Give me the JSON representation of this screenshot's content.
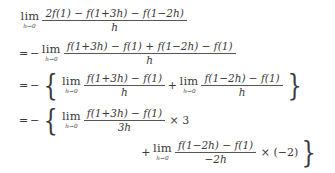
{
  "document": {
    "type": "math-derivation",
    "subject": "limit-of-difference-quotient",
    "background_color": "#ffffff",
    "text_color": "#3a3a3a"
  },
  "symbols": {
    "lim": "lim",
    "lim_subscript": "h→0",
    "equals": "=",
    "minus": "−",
    "plus": "+",
    "times": "×",
    "open_brace": "{",
    "close_brace": "}",
    "f": "f",
    "h": "h",
    "one": "1",
    "two": "2",
    "three": "3",
    "paren_open": "(",
    "paren_close": ")"
  },
  "lines": [
    {
      "id": "line1",
      "label": "original-limit",
      "prefix": "",
      "lim_sub": "h→0",
      "numerator": "2f(1) − f(1+3h) − f(1−2h)",
      "denominator": "h"
    },
    {
      "id": "line2",
      "label": "factored-negative",
      "prefix": "= −",
      "lim_sub": "h→0",
      "numerator": "f(1+3h) − f(1) + f(1−2h) − f(1)",
      "denominator": "h"
    },
    {
      "id": "line3",
      "label": "split-into-two-limits",
      "prefix": "= −",
      "open_delim": "{",
      "close_delim": "}",
      "term_a": {
        "lim_sub": "h→0",
        "numerator": "f(1+3h) − f(1)",
        "denominator": "h"
      },
      "joiner": "+",
      "term_b": {
        "lim_sub": "h→0",
        "numerator": "f(1−2h) − f(1)",
        "denominator": "h"
      }
    },
    {
      "id": "line4",
      "label": "scaled-first-derivative-term",
      "prefix": "= −",
      "open_delim": "{",
      "lim_sub": "h→0",
      "numerator": "f(1+3h) − f(1)",
      "denominator": "3h",
      "multiplier": "× 3"
    },
    {
      "id": "line5",
      "label": "scaled-second-derivative-term",
      "prefix": "+",
      "lim_sub": "h→0",
      "numerator": "f(1−2h) − f(1)",
      "denominator": "−2h",
      "multiplier": "× (−2)",
      "close_delim": "}"
    }
  ],
  "tokens": {
    "l1_num_2": "2",
    "l1_num_f1": "f(1)",
    "l1_num_minus1": "−",
    "l1_num_f13h": "f(1+3h)",
    "l1_num_minus2": "−",
    "l1_num_f12h": "f(1−2h)",
    "l1_den": "h",
    "l2_eq": "=",
    "l2_neg": "−",
    "l2_num_f13h": "f(1+3h)",
    "l2_num_m1": "−",
    "l2_num_f1a": "f(1)",
    "l2_num_p": "+",
    "l2_num_f12h": "f(1−2h)",
    "l2_num_m2": "−",
    "l2_num_f1b": "f(1)",
    "l2_den": "h",
    "l3_eq": "=",
    "l3_neg": "−",
    "l3_open": "{",
    "l3_a_num": "f(1+3h) − f(1)",
    "l3_a_den": "h",
    "l3_plus": "+",
    "l3_b_num": "f(1−2h) − f(1)",
    "l3_b_den": "h",
    "l3_close": "}",
    "l4_eq": "=",
    "l4_neg": "−",
    "l4_open": "{",
    "l4_num": "f(1+3h) − f(1)",
    "l4_den": "3h",
    "l4_times": "×",
    "l4_factor": "3",
    "l5_plus": "+",
    "l5_num": "f(1−2h) − f(1)",
    "l5_den": "−2h",
    "l5_times": "×",
    "l5_factor": "(−2)",
    "l5_close": "}"
  }
}
